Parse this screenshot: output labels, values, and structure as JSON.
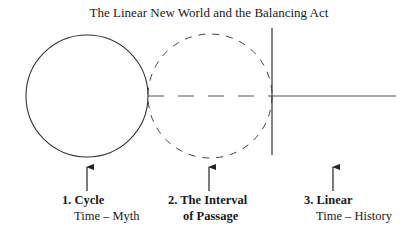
{
  "title": "The Linear New World and the Balancing Act",
  "stages": [
    {
      "number": "1.",
      "name": "Cycle",
      "heading": "1. Cycle",
      "subtitle": "Time – Myth",
      "shape": "solid-circle"
    },
    {
      "number": "2.",
      "name": "The Interval of Passage",
      "heading": "2. The Interval",
      "subtitle": "of Passage",
      "shape": "dashed-circle"
    },
    {
      "number": "3.",
      "name": "Linear",
      "heading": "3. Linear",
      "subtitle": "Time – History",
      "shape": "vertical-bar-with-line"
    }
  ],
  "colors": {
    "stroke": "#333333",
    "text": "#1a1a1a",
    "background": "#ffffff"
  }
}
